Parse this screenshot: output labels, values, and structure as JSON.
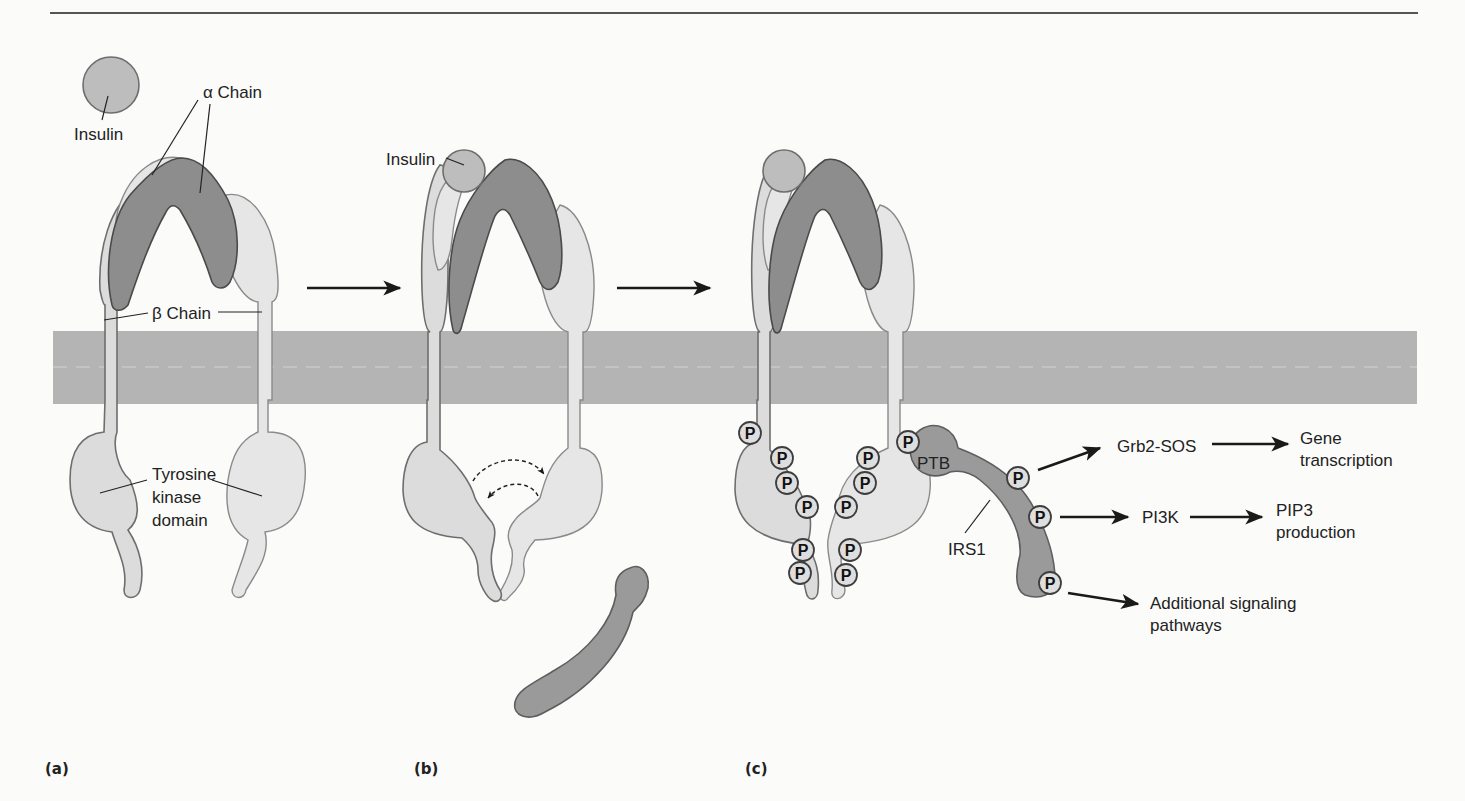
{
  "figure": {
    "panels": [
      {
        "id": "a",
        "label": "(a)"
      },
      {
        "id": "b",
        "label": "(b)"
      },
      {
        "id": "c",
        "label": "(c)"
      }
    ],
    "panel_a": {
      "insulin_label": "Insulin",
      "alpha_chain_label": "α Chain",
      "beta_chain_label": "β Chain",
      "tk_label_line1": "Tyrosine",
      "tk_label_line2": "kinase",
      "tk_label_line3": "domain"
    },
    "panel_b": {
      "insulin_label": "Insulin"
    },
    "panel_c": {
      "ptb_label": "PTB",
      "irs1_label": "IRS1",
      "phospho_label": "P",
      "pathways": [
        {
          "intermediate": "Grb2-SOS",
          "outcome_line1": "Gene",
          "outcome_line2": "transcription"
        },
        {
          "intermediate": "PI3K",
          "outcome_line1": "PIP3",
          "outcome_line2": "production"
        },
        {
          "intermediate": "",
          "outcome_line1": "Additional signaling",
          "outcome_line2": "pathways"
        }
      ]
    },
    "colors": {
      "membrane": "#b4b4b4",
      "alpha_chain": "#8d8d8d",
      "beta_chain": "#dcdcdc",
      "insulin": "#bdbdbd",
      "irs1": "#9a9a9a",
      "rule": "#555555"
    }
  }
}
